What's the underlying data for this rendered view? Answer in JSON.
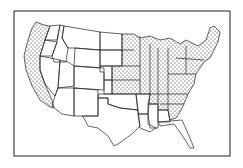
{
  "map": {
    "title": "",
    "region": "Contiguous United States",
    "style": "black-and-white line drawing with stippled shading",
    "colors": {
      "outline": "#1a1a1a",
      "stipple": "#222222",
      "background": "#ffffff"
    },
    "legend": null,
    "shaded_regions": [
      "Washington (western)",
      "Oregon (western)",
      "California",
      "Minnesota",
      "Wisconsin",
      "Michigan",
      "Iowa",
      "Missouri",
      "Illinois",
      "Indiana",
      "Ohio",
      "Kentucky",
      "Tennessee",
      "eastern Nebraska",
      "eastern Kansas",
      "Pennsylvania",
      "New York",
      "New England",
      "Virginia",
      "West Virginia",
      "North Carolina",
      "South Carolina",
      "Georgia",
      "Alabama (northern)",
      "Maryland",
      "New Jersey",
      "Delaware"
    ],
    "unshaded_regions": [
      "Idaho",
      "Montana",
      "Wyoming",
      "Nevada",
      "Utah",
      "Colorado",
      "Arizona",
      "New Mexico",
      "North Dakota",
      "South Dakota",
      "Oklahoma",
      "Texas",
      "Arkansas",
      "Louisiana",
      "Mississippi",
      "Florida"
    ]
  }
}
